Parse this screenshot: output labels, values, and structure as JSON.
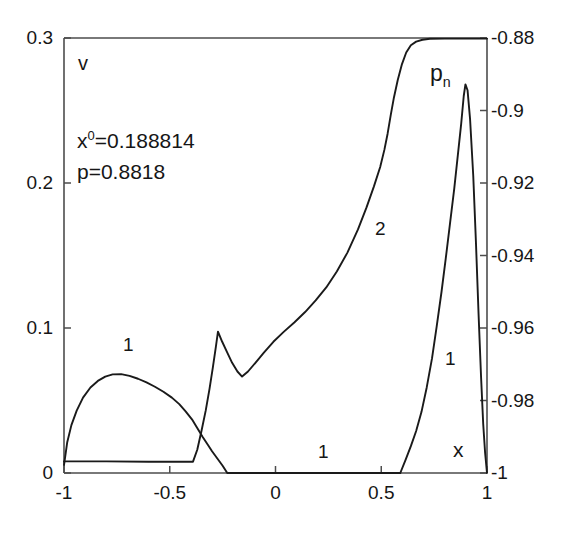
{
  "figure": {
    "background_color": "#ffffff",
    "line_color": "#1a1a1a",
    "axis_color": "#4d4d4d"
  },
  "annotations": {
    "left_axis_symbol": "v",
    "right_axis_symbol_base": "p",
    "right_axis_symbol_sub": "n",
    "x_axis_symbol": "x",
    "info_line1_base": "x",
    "info_line1_sup": "0",
    "info_line1_rest": "=0.188814",
    "info_line2": "p=0.8818",
    "curve_label_v_left": "1",
    "curve_label_pn_flat": "1",
    "curve_label_pn_rise": "2",
    "curve_label_v_spike": "1"
  },
  "chart_data": {
    "type": "line",
    "title": "",
    "xlabel": "x",
    "ylabel_left": "v",
    "ylabel_right": "p_n",
    "grid": false,
    "legend": "inline-curve-numbers",
    "xlim": [
      -1,
      1
    ],
    "ylim_left": [
      0,
      0.3
    ],
    "ylim_right": [
      -1,
      -0.88
    ],
    "xticks": [
      -1,
      -0.5,
      0,
      0.5,
      1
    ],
    "xtick_labels": [
      "-1",
      "-0.5",
      "0",
      "0.5",
      "1"
    ],
    "yticks_left": [
      0,
      0.1,
      0.2,
      0.3
    ],
    "ytick_labels_left": [
      "0",
      "0.1",
      "0.2",
      "0.3"
    ],
    "yticks_right": [
      -1,
      -0.98,
      -0.96,
      -0.94,
      -0.92,
      -0.9,
      -0.88
    ],
    "ytick_labels_right": [
      "-1",
      "-0.98",
      "-0.96",
      "-0.94",
      "-0.92",
      "-0.9",
      "-0.88"
    ],
    "annotation_values": {
      "x0": 0.188814,
      "p": 0.8818
    },
    "series": [
      {
        "name": "v (curve 1, left hump)",
        "label": "1",
        "axis": "left",
        "points": [
          [
            -1.0,
            0.0055
          ],
          [
            -0.985,
            0.021
          ],
          [
            -0.965,
            0.033
          ],
          [
            -0.94,
            0.043
          ],
          [
            -0.91,
            0.052
          ],
          [
            -0.875,
            0.059
          ],
          [
            -0.84,
            0.0635
          ],
          [
            -0.805,
            0.0665
          ],
          [
            -0.77,
            0.068
          ],
          [
            -0.73,
            0.0682
          ],
          [
            -0.69,
            0.067
          ],
          [
            -0.65,
            0.065
          ],
          [
            -0.61,
            0.0625
          ],
          [
            -0.57,
            0.0595
          ],
          [
            -0.53,
            0.056
          ],
          [
            -0.49,
            0.052
          ],
          [
            -0.455,
            0.0475
          ],
          [
            -0.425,
            0.0425
          ],
          [
            -0.395,
            0.037
          ],
          [
            -0.37,
            0.031
          ],
          [
            -0.345,
            0.025
          ],
          [
            -0.32,
            0.0195
          ],
          [
            -0.3,
            0.015
          ],
          [
            -0.275,
            0.01
          ],
          [
            -0.25,
            0.005
          ],
          [
            -0.228,
            0.0
          ],
          [
            0.59,
            0.0
          ]
        ]
      },
      {
        "name": "v (curve 1, right spike)",
        "label": "1",
        "axis": "left",
        "points": [
          [
            0.59,
            0.0
          ],
          [
            0.615,
            0.009
          ],
          [
            0.64,
            0.0185
          ],
          [
            0.665,
            0.029
          ],
          [
            0.69,
            0.042
          ],
          [
            0.715,
            0.059
          ],
          [
            0.74,
            0.079
          ],
          [
            0.762,
            0.101
          ],
          [
            0.785,
            0.125
          ],
          [
            0.805,
            0.148
          ],
          [
            0.825,
            0.172
          ],
          [
            0.845,
            0.196
          ],
          [
            0.862,
            0.219
          ],
          [
            0.878,
            0.241
          ],
          [
            0.89,
            0.26
          ],
          [
            0.898,
            0.268
          ],
          [
            0.908,
            0.264
          ],
          [
            0.92,
            0.244
          ],
          [
            0.935,
            0.205
          ],
          [
            0.948,
            0.158
          ],
          [
            0.96,
            0.11
          ],
          [
            0.972,
            0.066
          ],
          [
            0.982,
            0.034
          ],
          [
            0.991,
            0.014
          ],
          [
            1.0,
            0.0
          ]
        ]
      },
      {
        "name": "p_n (curve 1 flat / curve 2 rising)",
        "label": "1 then 2",
        "axis": "right",
        "points": [
          [
            -1.0,
            0.008
          ],
          [
            -0.8,
            0.008
          ],
          [
            -0.6,
            0.0078
          ],
          [
            -0.45,
            0.0078
          ],
          [
            -0.39,
            0.0078
          ],
          [
            -0.37,
            0.016
          ],
          [
            -0.35,
            0.029
          ],
          [
            -0.33,
            0.043
          ],
          [
            -0.312,
            0.058
          ],
          [
            -0.296,
            0.073
          ],
          [
            -0.282,
            0.087
          ],
          [
            -0.272,
            0.0975
          ],
          [
            -0.252,
            0.0905
          ],
          [
            -0.228,
            0.083
          ],
          [
            -0.205,
            0.076
          ],
          [
            -0.18,
            0.07
          ],
          [
            -0.158,
            0.0665
          ],
          [
            -0.13,
            0.07
          ],
          [
            -0.095,
            0.076
          ],
          [
            -0.055,
            0.083
          ],
          [
            -0.01,
            0.0905
          ],
          [
            0.04,
            0.0975
          ],
          [
            0.09,
            0.104
          ],
          [
            0.14,
            0.111
          ],
          [
            0.19,
            0.119
          ],
          [
            0.24,
            0.128
          ],
          [
            0.29,
            0.139
          ],
          [
            0.34,
            0.152
          ],
          [
            0.39,
            0.168
          ],
          [
            0.43,
            0.183
          ],
          [
            0.465,
            0.1975
          ],
          [
            0.495,
            0.211
          ],
          [
            0.515,
            0.223
          ],
          [
            0.53,
            0.234
          ],
          [
            0.545,
            0.247
          ],
          [
            0.56,
            0.259
          ],
          [
            0.578,
            0.271
          ],
          [
            0.598,
            0.282
          ],
          [
            0.618,
            0.29
          ],
          [
            0.64,
            0.295
          ],
          [
            0.665,
            0.2975
          ],
          [
            0.695,
            0.2988
          ],
          [
            0.73,
            0.2995
          ],
          [
            0.8,
            0.2996
          ],
          [
            0.9,
            0.2996
          ],
          [
            1.0,
            0.2996
          ]
        ]
      }
    ]
  }
}
